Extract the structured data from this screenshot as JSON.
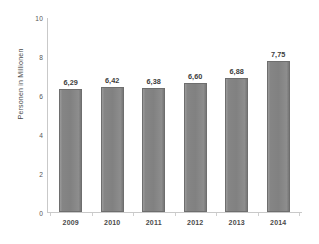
{
  "chart_data": {
    "type": "bar",
    "title": "",
    "subtitle": "",
    "xlabel": "",
    "ylabel": "Personen in Millionen",
    "categories": [
      "2009",
      "2010",
      "2011",
      "2012",
      "2013",
      "2014"
    ],
    "values": [
      6.29,
      6.42,
      6.38,
      6.6,
      6.88,
      7.75
    ],
    "value_labels": [
      "6,29",
      "6,42",
      "6,38",
      "6,60",
      "6,88",
      "7,75"
    ],
    "series": [
      {
        "name": "Personen in Millionen",
        "values": [
          6.29,
          6.42,
          6.38,
          6.6,
          6.88,
          7.75
        ]
      }
    ],
    "ylim": [
      0,
      10
    ],
    "ytick_labels": [
      "0",
      "2",
      "4",
      "6",
      "8",
      "10"
    ],
    "ytick_values": [
      0,
      2,
      4,
      6,
      8,
      10
    ],
    "grid": false,
    "legend": false,
    "legend_position": "none",
    "bar_color": "#858585",
    "bar_border_color": "#6e6e6e",
    "axis_color": "#c9c9c9",
    "background_color": "#ffffff",
    "text_color": "#3d3d3d",
    "decimal_separator": ","
  }
}
